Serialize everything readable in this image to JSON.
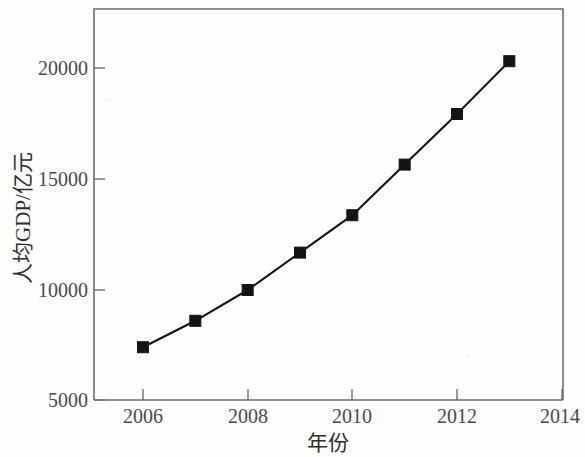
{
  "chart_data": {
    "type": "line",
    "title": "",
    "xlabel": "年份",
    "ylabel": "人均GDP/亿元",
    "x": [
      2006,
      2007,
      2008,
      2009,
      2010,
      2011,
      2012,
      2013
    ],
    "categories": [
      "2006",
      "2007",
      "2008",
      "2009",
      "2010",
      "2011",
      "2012",
      "2013"
    ],
    "values": [
      7400,
      8600,
      10000,
      11700,
      13400,
      15700,
      18000,
      20400
    ],
    "series": [
      {
        "name": "人均GDP",
        "values": [
          7400,
          8600,
          10000,
          11700,
          13400,
          15700,
          18000,
          20400
        ]
      }
    ],
    "xlim": [
      2005,
      2014
    ],
    "ylim": [
      5000,
      22000
    ],
    "x_ticks": [
      2006,
      2008,
      2010,
      2012,
      2014
    ],
    "x_tick_labels": [
      "2006",
      "2008",
      "2010",
      "2012",
      "2014"
    ],
    "y_ticks": [
      5000,
      10000,
      15000,
      20000
    ],
    "y_tick_labels": [
      "5000",
      "10000",
      "15000",
      "20000"
    ],
    "grid": false,
    "legend": false,
    "legend_position": "none",
    "marker": "square",
    "line_color": "#141414",
    "marker_color": "#141414",
    "axis_color": "#6d6d6d"
  },
  "axes": {
    "x_title": "年份",
    "y_title": "人均GDP/亿元"
  },
  "y_tick_labels": [
    {
      "value": "20000"
    },
    {
      "value": "15000"
    },
    {
      "value": "10000"
    },
    {
      "value": "5000"
    }
  ],
  "x_tick_labels": [
    {
      "value": "2006"
    },
    {
      "value": "2008"
    },
    {
      "value": "2010"
    },
    {
      "value": "2012"
    },
    {
      "value": "2014"
    }
  ]
}
